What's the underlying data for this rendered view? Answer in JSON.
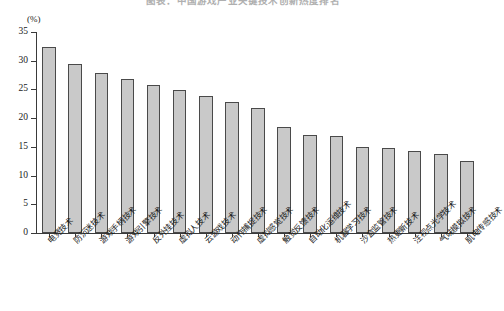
{
  "chart_data": {
    "type": "bar",
    "title": "图表：中国游戏产业关键技术创新热度排名",
    "xlabel": "",
    "ylabel": "",
    "unit_label": "(%)",
    "ylim": [
      0,
      35
    ],
    "ytick_step": 5,
    "yticks": [
      0,
      5,
      10,
      15,
      20,
      25,
      30,
      35
    ],
    "ytick_labels": [
      "0",
      "5",
      "10",
      "15",
      "20",
      "25",
      "30",
      "35"
    ],
    "grid": false,
    "legend": false,
    "bar_fill_color": "#c9c9c9",
    "bar_edge_color": "#4a4a4a",
    "categories": [
      "电竞技术",
      "防沉迷技术",
      "游戏手柄技术",
      "游戏引擎技术",
      "反外挂技术",
      "虚拟人技术",
      "云游戏技术",
      "动作捕捉技术",
      "虚拟感觉技术",
      "触觉反馈技术",
      "自动化运维技术",
      "机器学习技术",
      "沙盒监管技术",
      "热更新技术",
      "注视点光学技术",
      "气味模拟技术",
      "肌电传感技术"
    ],
    "values": [
      32.4,
      29.5,
      27.9,
      26.9,
      25.8,
      24.9,
      23.8,
      22.8,
      21.8,
      18.5,
      17.0,
      16.9,
      14.9,
      14.8,
      14.2,
      13.8,
      12.5
    ]
  }
}
